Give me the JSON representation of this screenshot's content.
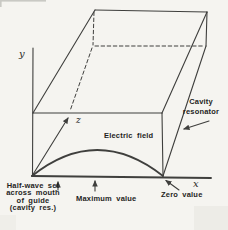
{
  "figure": {
    "type": "physics-diagram",
    "background_color": "#f5f4f0",
    "line_color": "#3f3f3d",
    "text_color": "#1f1f1d",
    "axes": {
      "x": "x",
      "y": "y",
      "z": "z"
    },
    "labels": {
      "electric_field": "Electric field",
      "cavity_resonator": {
        "line1": "Cavity",
        "line2": "resonator"
      },
      "half_wave": {
        "line1": "Half-wave set",
        "line2": "across mouth",
        "line3": "of guide",
        "line4": "(cavity res.)"
      },
      "maximum_value": "Maximum value",
      "zero_value": "Zero value"
    }
  }
}
